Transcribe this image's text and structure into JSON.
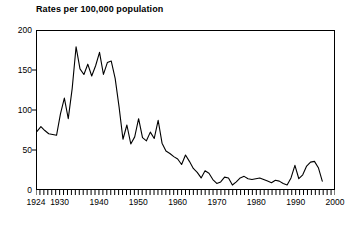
{
  "chart_data": {
    "type": "line",
    "title": "Rates per 100,000 population",
    "xlabel": "",
    "ylabel": "",
    "xlim": [
      1924,
      2000
    ],
    "ylim": [
      0,
      200
    ],
    "grid": false,
    "legend": null,
    "axis": {
      "y_ticks": [
        0,
        50,
        100,
        150,
        200
      ],
      "y_tick_labels": [
        "0",
        "50",
        "100",
        "150",
        "200"
      ],
      "x_tick_labels": [
        "1924",
        "1930",
        "1940",
        "1950",
        "1960",
        "1970",
        "1980",
        "1990",
        "2000"
      ],
      "x_tick_label_years": [
        1924,
        1930,
        1940,
        1950,
        1960,
        1970,
        1980,
        1990,
        2000
      ],
      "x_minor_tick_interval": 1,
      "x_minor_tick_start": 1924,
      "x_minor_tick_end": 2000
    },
    "series": [
      {
        "name": "Rate per 100,000 population",
        "color": "#000000",
        "x": [
          1924,
          1925,
          1926,
          1927,
          1928,
          1929,
          1930,
          1931,
          1932,
          1933,
          1934,
          1935,
          1936,
          1937,
          1938,
          1939,
          1940,
          1941,
          1942,
          1943,
          1944,
          1945,
          1946,
          1947,
          1948,
          1949,
          1950,
          1951,
          1952,
          1953,
          1954,
          1955,
          1956,
          1957,
          1958,
          1959,
          1960,
          1961,
          1962,
          1963,
          1964,
          1965,
          1966,
          1967,
          1968,
          1969,
          1970,
          1971,
          1972,
          1973,
          1974,
          1975,
          1976,
          1977,
          1978,
          1979,
          1980,
          1981,
          1982,
          1983,
          1984,
          1985,
          1986,
          1987,
          1988,
          1989,
          1990,
          1991,
          1992,
          1993,
          1994,
          1995,
          1996,
          1997
        ],
        "values": [
          73,
          79,
          74,
          70,
          69,
          68,
          95,
          115,
          89,
          127,
          180,
          152,
          145,
          158,
          143,
          156,
          173,
          145,
          160,
          162,
          140,
          104,
          63,
          81,
          57,
          66,
          89,
          65,
          61,
          72,
          64,
          87,
          58,
          48,
          45,
          41,
          38,
          31,
          43,
          35,
          26,
          21,
          14,
          23,
          20,
          12,
          7,
          9,
          15,
          14,
          5,
          9,
          14,
          16,
          13,
          12,
          13,
          14,
          12,
          10,
          8,
          11,
          10,
          7,
          5,
          14,
          30,
          13,
          18,
          29,
          34,
          35,
          27,
          10
        ]
      }
    ]
  }
}
